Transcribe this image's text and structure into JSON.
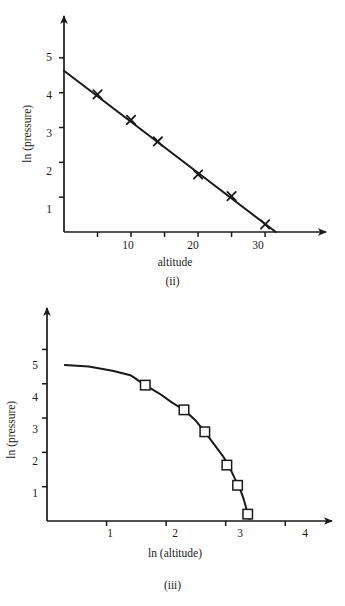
{
  "figures": [
    {
      "id": "ii",
      "caption": "(ii)",
      "xlabel": "altitude",
      "ylabel": "ln (pressure)",
      "x_tick_labels": [
        "10",
        "20",
        "30"
      ],
      "y_tick_labels": [
        "1",
        "2",
        "3",
        "4",
        "5"
      ]
    },
    {
      "id": "iii",
      "caption": "(iii)",
      "xlabel": "ln (altitude)",
      "ylabel": "ln (pressure)",
      "x_tick_labels": [
        "1",
        "2",
        "3",
        "4"
      ],
      "y_tick_labels": [
        "1",
        "2",
        "3",
        "4",
        "5"
      ]
    }
  ],
  "chart_data": [
    {
      "type": "scatter",
      "title": "(ii)",
      "xlabel": "altitude",
      "ylabel": "ln (pressure)",
      "xlim": [
        0,
        37
      ],
      "ylim": [
        0,
        5.8
      ],
      "x_ticks": [
        5,
        10,
        15,
        20,
        25,
        30
      ],
      "x_tick_labels": [
        "",
        "10",
        "",
        "20",
        "",
        "30"
      ],
      "y_ticks": [
        1,
        2,
        3,
        4,
        5
      ],
      "y_tick_labels": [
        "1",
        "2",
        "3",
        "4",
        "5"
      ],
      "grid": false,
      "legend": "none",
      "marker": "cross",
      "fit_line": {
        "x": [
          0,
          31.6
        ],
        "y": [
          4.63,
          0.0
        ],
        "intercept": 4.63,
        "slope": -0.1465
      },
      "points": [
        {
          "x": 5,
          "y": 3.95
        },
        {
          "x": 10,
          "y": 3.22
        },
        {
          "x": 14,
          "y": 2.6
        },
        {
          "x": 20,
          "y": 1.65
        },
        {
          "x": 25,
          "y": 1.03
        },
        {
          "x": 30,
          "y": 0.22
        }
      ]
    },
    {
      "type": "line",
      "title": "(iii)",
      "xlabel": "ln (altitude)",
      "ylabel": "ln (pressure)",
      "xlim": [
        0,
        4.55
      ],
      "ylim": [
        0,
        5.8
      ],
      "x_ticks": [
        1,
        2,
        3,
        4
      ],
      "x_tick_labels": [
        "1",
        "2",
        "3",
        "4"
      ],
      "y_ticks": [
        1,
        2,
        3,
        4,
        5
      ],
      "y_tick_labels": [
        "1",
        "2",
        "3",
        "4",
        "5"
      ],
      "grid": false,
      "legend": "none",
      "marker": "open-square",
      "curve": [
        {
          "x": 0.3,
          "y": 4.55
        },
        {
          "x": 0.7,
          "y": 4.5
        },
        {
          "x": 1.1,
          "y": 4.38
        },
        {
          "x": 1.4,
          "y": 4.25
        },
        {
          "x": 1.65,
          "y": 3.96
        },
        {
          "x": 1.9,
          "y": 3.7
        },
        {
          "x": 2.1,
          "y": 3.45
        },
        {
          "x": 2.3,
          "y": 3.24
        },
        {
          "x": 2.5,
          "y": 2.92
        },
        {
          "x": 2.65,
          "y": 2.6
        },
        {
          "x": 2.8,
          "y": 2.25
        },
        {
          "x": 2.95,
          "y": 1.9
        },
        {
          "x": 3.05,
          "y": 1.62
        },
        {
          "x": 3.15,
          "y": 1.25
        },
        {
          "x": 3.22,
          "y": 1.03
        },
        {
          "x": 3.3,
          "y": 0.65
        },
        {
          "x": 3.37,
          "y": 0.22
        },
        {
          "x": 3.4,
          "y": 0.05
        }
      ],
      "points": [
        {
          "x": 1.65,
          "y": 3.96
        },
        {
          "x": 2.3,
          "y": 3.24
        },
        {
          "x": 2.65,
          "y": 2.6
        },
        {
          "x": 3.02,
          "y": 1.63
        },
        {
          "x": 3.2,
          "y": 1.04
        },
        {
          "x": 3.37,
          "y": 0.2
        }
      ]
    }
  ]
}
